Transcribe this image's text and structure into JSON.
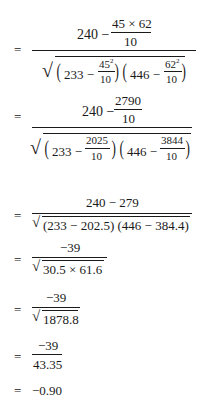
{
  "steps": [
    {
      "equals": "=",
      "numerator": {
        "lead": "240 −",
        "frac_num": "45 × 62",
        "frac_den": "10"
      },
      "denominator": {
        "term1": {
          "lead": "233 −",
          "num_base": "45",
          "num_exp": "2",
          "den": "10"
        },
        "term2": {
          "lead": "446 −",
          "num_base": "62",
          "num_exp": "2",
          "den": "10"
        }
      }
    },
    {
      "equals": "=",
      "numerator": {
        "lead": "240 −",
        "frac_num": "2790",
        "frac_den": "10"
      },
      "denominator": {
        "term1": {
          "lead": "233 −",
          "num": "2025",
          "den": "10"
        },
        "term2": {
          "lead": "446 −",
          "num": "3844",
          "den": "10"
        }
      }
    },
    {
      "equals": "=",
      "numerator": "240 − 279",
      "denominator": "(233 − 202.5) (446 − 384.4)"
    },
    {
      "equals": "=",
      "numerator": "−39",
      "denominator": "30.5 × 61.6"
    },
    {
      "equals": "=",
      "numerator": "−39",
      "denominator": "1878.8"
    },
    {
      "equals": "=",
      "numerator": "−39",
      "denominator": "43.35"
    },
    {
      "equals": "=",
      "result": "−0.90"
    }
  ]
}
